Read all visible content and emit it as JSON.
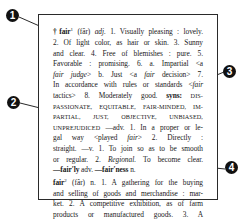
{
  "callouts": [
    {
      "num": "1",
      "target": "headword"
    },
    {
      "num": "2",
      "target": "synonyms"
    },
    {
      "num": "3",
      "target": "example"
    },
    {
      "num": "4",
      "target": "homograph"
    }
  ],
  "entry": {
    "lines": [
      {
        "a": "†fair",
        "sup": "1",
        "b": " (fâr) ",
        "c": "adj.",
        "d": "  1. Visually pleasing : lovely."
      },
      {
        "t": "2. Of light color, as hair or skin.  3. Sunny"
      },
      {
        "t": "and clear.  4. Free of blemishes : pure.  5."
      },
      {
        "t1": "Favorable : promising.  6. a. Impartial <",
        "i": "a",
        "t2": ""
      },
      {
        "i1": "fair judge",
        "t1": "> b. Just <a ",
        "i2": "fair",
        "t2": " decision>  7."
      },
      {
        "t1": "In accordance with rules or standards <",
        "i": "fair",
        "t2": ""
      },
      {
        "t1": "tactics>  8. Moderately good.  ",
        "b": "syns:",
        "sc": " DIS-"
      },
      {
        "sc": "PASSIONATE, EQUITABLE, FAIR-MINDED, IM-"
      },
      {
        "sc": "PARTIAL,  JUST,  OBJECTIVE,  UNBIASED,"
      },
      {
        "sc": "UNPREJUDICED",
        "t": "  —adv.  1. In a proper or le-"
      },
      {
        "t1": "gal way  <played ",
        "i": "fair",
        "t2": ">  2. Directly :"
      },
      {
        "t": "straight.  —v.  1. To join so as to be smooth"
      },
      {
        "t1": "or regular.  2. ",
        "i": "Regional.",
        "t2": " To become clear."
      },
      {
        "b1": "—fair′ly",
        "t1": " adv.  ",
        "b2": "—fair′ness",
        "t2": " n."
      },
      {
        "a": "fair",
        "sup": "2",
        "b": " (fâr) n.  1. A gathering for the buying"
      },
      {
        "t": "and selling of goods and merchandise : mar-"
      },
      {
        "t": "ket.  2. A competitive exhibition, as of farm"
      },
      {
        "t": "products  or  manufactured  goods.   3. A"
      },
      {
        "t": "fund-raising event, as for a charity."
      }
    ]
  }
}
